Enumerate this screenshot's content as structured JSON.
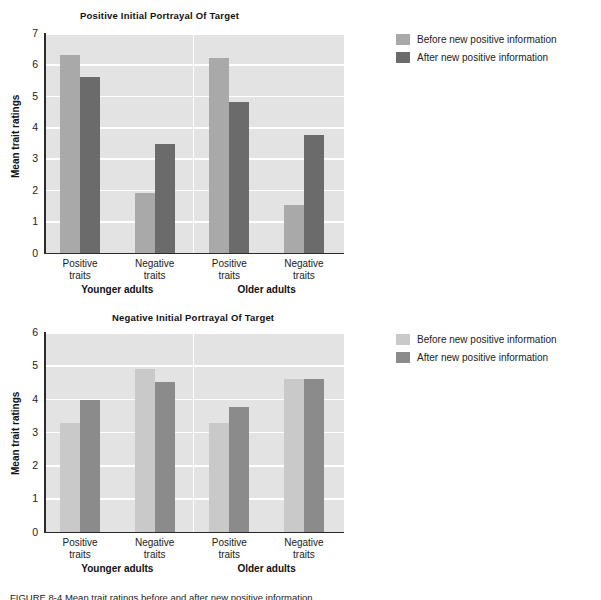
{
  "figure": {
    "caption": "FIGURE 8-4  Mean trait ratings before and after new positive information."
  },
  "legend": {
    "before_label": "Before new positive information",
    "after_label": "After new positive information",
    "top_before_color": "#a9a9a9",
    "top_after_color": "#6b6b6b",
    "bottom_before_color": "#c9c9c9",
    "bottom_after_color": "#8b8b8b"
  },
  "chart_data": [
    {
      "type": "bar",
      "id": "positive-initial-portrayal",
      "title": "Positive Initial Portrayal Of Target",
      "xlabel": "",
      "ylabel": "Mean trait ratings",
      "ylim": [
        0,
        7
      ],
      "yticks": [
        "0",
        "1",
        "2",
        "3",
        "4",
        "5",
        "6",
        "7"
      ],
      "grid": true,
      "legend_position": "right",
      "groups": [
        "Younger adults",
        "Older adults"
      ],
      "categories": [
        "Positive\ntraits",
        "Negative\ntraits",
        "Positive\ntraits",
        "Negative\ntraits"
      ],
      "series": [
        {
          "name": "Before new positive information",
          "color": "#a9a9a9",
          "values": [
            6.3,
            1.9,
            6.2,
            1.5
          ]
        },
        {
          "name": "After new positive information",
          "color": "#6b6b6b",
          "values": [
            5.6,
            3.45,
            4.8,
            3.75
          ]
        }
      ]
    },
    {
      "type": "bar",
      "id": "negative-initial-portrayal",
      "title": "Negative Initial Portrayal Of Target",
      "xlabel": "",
      "ylabel": "Mean trait ratings",
      "ylim": [
        0,
        6
      ],
      "yticks": [
        "0",
        "1",
        "2",
        "3",
        "4",
        "5",
        "6"
      ],
      "grid": true,
      "legend_position": "right",
      "groups": [
        "Younger adults",
        "Older adults"
      ],
      "categories": [
        "Positive\ntraits",
        "Negative\ntraits",
        "Positive\ntraits",
        "Negative\ntraits"
      ],
      "series": [
        {
          "name": "Before new positive information",
          "color": "#c9c9c9",
          "values": [
            3.25,
            4.9,
            3.25,
            4.6
          ]
        },
        {
          "name": "After new positive information",
          "color": "#8b8b8b",
          "values": [
            3.95,
            4.5,
            3.75,
            4.6
          ]
        }
      ]
    }
  ]
}
